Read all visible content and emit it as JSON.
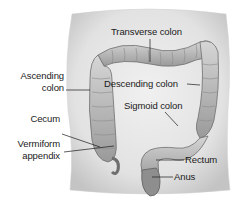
{
  "figure": {
    "labels": {
      "transverse_colon": "Transverse colon",
      "ascending_colon_line1": "Ascending",
      "ascending_colon_line2": "colon",
      "descending_colon": "Descending colon",
      "sigmoid_colon": "Sigmoid colon",
      "cecum": "Cecum",
      "vermiform_appendix_line1": "Vermiform",
      "vermiform_appendix_line2": "appendix",
      "rectum": "Rectum",
      "anus": "Anus"
    },
    "colors": {
      "background": "#ffffff",
      "torso_fill": "#e4e4e4",
      "torso_shade": "#c8c8c8",
      "colon_fill": "#bdbdbd",
      "colon_dark": "#7a7a7a",
      "text": "#1a1a1a",
      "leader_line": "#1a1a1a"
    }
  }
}
